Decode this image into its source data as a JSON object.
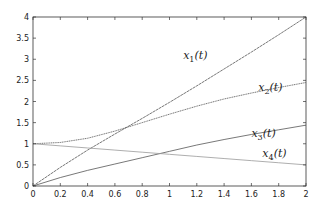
{
  "chart_data": {
    "type": "line",
    "title": "",
    "xlabel": "",
    "ylabel": "",
    "xlim": [
      0,
      2
    ],
    "ylim": [
      0,
      4
    ],
    "grid": false,
    "legend": "none",
    "x_ticks": [
      "0",
      "0.2",
      "0.4",
      "0.6",
      "0.8",
      "1",
      "1.2",
      "1.4",
      "1.6",
      "1.8",
      "2"
    ],
    "y_ticks": [
      "0",
      "0.5",
      "1",
      "1.5",
      "2",
      "2.5",
      "3",
      "3.5",
      "4"
    ],
    "x": [
      0,
      0.2,
      0.4,
      0.6,
      0.8,
      1.0,
      1.2,
      1.4,
      1.6,
      1.8,
      2.0
    ],
    "series": [
      {
        "name": "x1(t)",
        "label_pos": [
          1.1,
          3.0
        ],
        "values": [
          0.0,
          0.44,
          0.85,
          1.23,
          1.6,
          1.98,
          2.37,
          2.77,
          3.17,
          3.58,
          4.0
        ]
      },
      {
        "name": "x2(t)",
        "label_pos": [
          1.65,
          2.25
        ],
        "values": [
          1.0,
          1.03,
          1.13,
          1.3,
          1.5,
          1.7,
          1.89,
          2.06,
          2.2,
          2.33,
          2.45
        ]
      },
      {
        "name": "x3(t)",
        "label_pos": [
          1.6,
          1.17
        ],
        "values": [
          0.0,
          0.2,
          0.37,
          0.52,
          0.67,
          0.82,
          0.97,
          1.1,
          1.22,
          1.33,
          1.44
        ]
      },
      {
        "name": "x4(t)",
        "label_pos": [
          1.68,
          0.68
        ],
        "values": [
          1.0,
          0.95,
          0.9,
          0.85,
          0.8,
          0.75,
          0.7,
          0.65,
          0.6,
          0.55,
          0.5
        ]
      }
    ]
  },
  "colors": {
    "axis": "#333333",
    "line": "#555555",
    "line_light": "#999999"
  }
}
